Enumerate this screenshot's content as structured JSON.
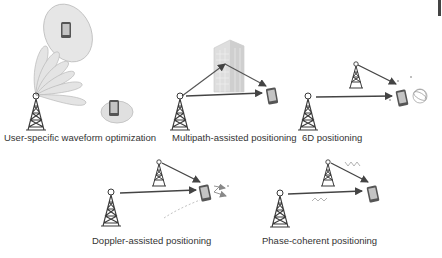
{
  "panels": [
    {
      "id": "waveform",
      "label": "User-specific waveform optimization"
    },
    {
      "id": "multipath",
      "label": "Multipath-assisted positioning"
    },
    {
      "id": "6d",
      "label": "6D positioning"
    },
    {
      "id": "doppler",
      "label": "Doppler-assisted positioning"
    },
    {
      "id": "phase",
      "label": "Phase-coherent positioning"
    }
  ],
  "colors": {
    "tower": "#3a3a3a",
    "beam_fill": "#e4e4e4",
    "beam_stroke": "#b8b8b8",
    "arrow": "#444444",
    "phone_body": "#555555",
    "phone_screen": "#bdbdbd",
    "building": "#dcdcdc",
    "wave": "#b0b0b0",
    "label": "#333333"
  }
}
